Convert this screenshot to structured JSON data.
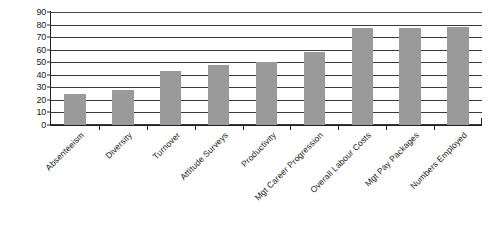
{
  "chart_data": {
    "type": "bar",
    "title": "",
    "subtitle": "",
    "xlabel": "",
    "ylabel": "",
    "ylim": [
      0,
      90
    ],
    "ytick_step": 10,
    "yticks": [
      0,
      10,
      20,
      30,
      40,
      50,
      60,
      70,
      80,
      90
    ],
    "grid": true,
    "legend": false,
    "legend_position": "none",
    "categories": [
      "Absenteeism",
      "Diversity",
      "Turnover",
      "Attitude Surveys",
      "Productivity",
      "Mgt Career Progression",
      "Overall Labour Costs",
      "Mgt Pay Packages",
      "Numbers Employed"
    ],
    "values": [
      25,
      28,
      43,
      48,
      50,
      58,
      77,
      77,
      78
    ],
    "series": [
      {
        "name": "",
        "values": [
          25,
          28,
          43,
          48,
          50,
          58,
          77,
          77,
          78
        ],
        "color": "#9a9a9a"
      }
    ],
    "bar_color": "#9a9a9a",
    "axis_color": "#1f1f1f",
    "gridline_color": "#3a3a3a",
    "background_color": "#ffffff",
    "xlabel_rotation": -45
  }
}
